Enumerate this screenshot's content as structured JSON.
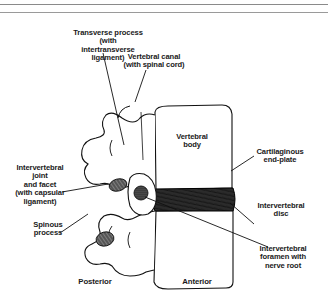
{
  "figure": {
    "labels": {
      "transverse_process": "Transverse process\n(with intertransverse\nligament)",
      "vertebral_canal": "Vertebral canal\n(with spinal cord)",
      "vertebral_body": "Vertebral\nbody",
      "cartilaginous_end_plate": "Cartilaginous\nend-plate",
      "intervertebral_joint": "Intervertebral\njoint\nand facet\n(with capsular\nligament)",
      "spinous_process": "Spinous\nprocess",
      "intervertebral_disc": "Intervertebral\ndisc",
      "intervertebral_foramen": "Intervertebral\nforamen with\nnerve root"
    },
    "orientation": {
      "posterior": "Posterior",
      "anterior": "Anterior"
    },
    "colors": {
      "ink": "#111111",
      "rule": "#8a8a8a",
      "background": "#ffffff"
    }
  }
}
